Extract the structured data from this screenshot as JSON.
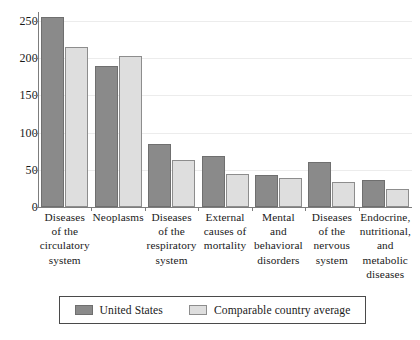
{
  "chart_data": {
    "type": "bar",
    "title": "",
    "subtitle": "",
    "xlabel": "",
    "ylabel": "",
    "ylim": [
      0,
      262
    ],
    "yticks": [
      0,
      50,
      100,
      150,
      200,
      250
    ],
    "ytick_labels": [
      "0",
      "50",
      "100",
      "150",
      "200",
      "250"
    ],
    "grid": true,
    "grid_axis": "y",
    "legend_position": "bottom",
    "categories": [
      "Diseases of the circulatory system",
      "Neoplasms",
      "Diseases of the respiratory system",
      "External causes of mortality",
      "Mental and behavioral disorders",
      "Diseases of the nervous system",
      "Endocrine, nutritional, and metabolic diseases"
    ],
    "category_label_lines": [
      [
        "Diseases",
        "of the",
        "circulatory",
        "system"
      ],
      [
        "Neoplasms"
      ],
      [
        "Diseases",
        "of the",
        "respiratory",
        "system"
      ],
      [
        "External",
        "causes of",
        "mortality"
      ],
      [
        "Mental",
        "and",
        "behavioral",
        "disorders"
      ],
      [
        "Diseases",
        "of the",
        "nervous",
        "system"
      ],
      [
        "Endocrine,",
        "nutritional,",
        "and",
        "metabolic",
        "diseases"
      ]
    ],
    "series": [
      {
        "name": "United States",
        "color": "#8a8a8a",
        "values": [
          255,
          190,
          85,
          68,
          43,
          60,
          36
        ]
      },
      {
        "name": "Comparable country average",
        "color": "#dedede",
        "values": [
          215,
          203,
          63,
          44,
          39,
          33,
          24
        ]
      }
    ]
  },
  "legend": {
    "items": [
      {
        "label": "United States",
        "swatch": "dark-gray-swatch"
      },
      {
        "label": "Comparable country average",
        "swatch": "light-gray-swatch"
      }
    ]
  }
}
